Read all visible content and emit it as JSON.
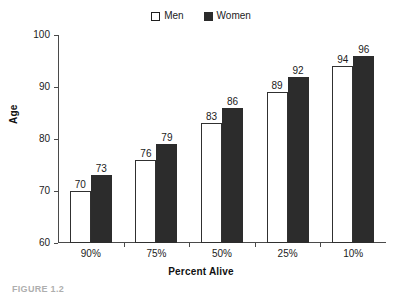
{
  "legend": {
    "position": "top-center",
    "entries": [
      {
        "label": "Men",
        "marker": "open-square",
        "color": "#ffffff"
      },
      {
        "label": "Women",
        "marker": "filled-square",
        "color": "#2c2c2c"
      }
    ]
  },
  "caption": {
    "text": "FIGURE 1.2"
  },
  "chart_data": {
    "type": "bar",
    "title": "",
    "xlabel": "Percent Alive",
    "ylabel": "Age",
    "categories": [
      "90%",
      "75%",
      "50%",
      "25%",
      "10%"
    ],
    "series": [
      {
        "name": "Men",
        "values": [
          70,
          76,
          83,
          89,
          94
        ]
      },
      {
        "name": "Women",
        "values": [
          73,
          79,
          86,
          92,
          96
        ]
      }
    ],
    "ylim": [
      60,
      100
    ],
    "yticks": [
      60,
      70,
      80,
      90,
      100
    ],
    "ytick_labels": [
      "60",
      "70",
      "80",
      "90",
      "100"
    ],
    "grid": false,
    "data_labels": true,
    "legend_position": "top-center"
  }
}
